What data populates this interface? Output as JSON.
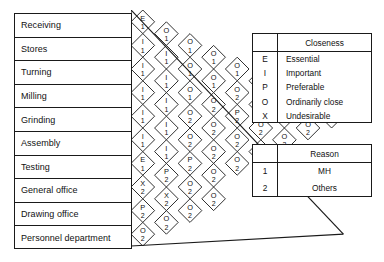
{
  "activities": [
    {
      "id": 1,
      "label": "Receiving"
    },
    {
      "id": 2,
      "label": "Stores"
    },
    {
      "id": 3,
      "label": "Turning"
    },
    {
      "id": 4,
      "label": "Milling"
    },
    {
      "id": 5,
      "label": "Grinding"
    },
    {
      "id": 6,
      "label": "Assembly"
    },
    {
      "id": 7,
      "label": "Testing"
    },
    {
      "id": 8,
      "label": "General office"
    },
    {
      "id": 9,
      "label": "Drawing office"
    },
    {
      "id": 10,
      "label": "Personnel department"
    }
  ],
  "relationship_matrix": {
    "description": "Activity relationship chart. Each diamond holds a closeness code (top) and a reason code (bottom).",
    "columns": [
      {
        "from": 1,
        "cells": [
          {
            "to": 2,
            "closeness": "E",
            "reason": "1"
          },
          {
            "to": 3,
            "closeness": "I",
            "reason": "1"
          },
          {
            "to": 4,
            "closeness": "I",
            "reason": "1"
          },
          {
            "to": 5,
            "closeness": "I",
            "reason": "1"
          },
          {
            "to": 6,
            "closeness": "I",
            "reason": "1"
          },
          {
            "to": 7,
            "closeness": "I",
            "reason": "1"
          },
          {
            "to": 8,
            "closeness": "E",
            "reason": "1"
          },
          {
            "to": 9,
            "closeness": "X",
            "reason": "2"
          },
          {
            "to": 10,
            "closeness": "P",
            "reason": "2"
          },
          {
            "to": 11,
            "closeness": "O",
            "reason": "2"
          }
        ]
      },
      {
        "from": 2,
        "cells": [
          {
            "to": 3,
            "closeness": "O",
            "reason": "1"
          },
          {
            "to": 4,
            "closeness": "I",
            "reason": "1"
          },
          {
            "to": 5,
            "closeness": "I",
            "reason": "1"
          },
          {
            "to": 6,
            "closeness": "I",
            "reason": "1"
          },
          {
            "to": 7,
            "closeness": "I",
            "reason": "1"
          },
          {
            "to": 8,
            "closeness": "I",
            "reason": "1"
          },
          {
            "to": 9,
            "closeness": "P",
            "reason": "2"
          },
          {
            "to": 10,
            "closeness": "X",
            "reason": "2"
          },
          {
            "to": 11,
            "closeness": "O",
            "reason": "2"
          }
        ]
      },
      {
        "from": 3,
        "cells": [
          {
            "to": 4,
            "closeness": "O",
            "reason": "1"
          },
          {
            "to": 5,
            "closeness": "O",
            "reason": "1"
          },
          {
            "to": 6,
            "closeness": "O",
            "reason": "1"
          },
          {
            "to": 7,
            "closeness": "O",
            "reason": "2"
          },
          {
            "to": 8,
            "closeness": "O",
            "reason": "2"
          },
          {
            "to": 9,
            "closeness": "P",
            "reason": "2"
          },
          {
            "to": 10,
            "closeness": "O",
            "reason": "2"
          },
          {
            "to": 11,
            "closeness": "O",
            "reason": "2"
          }
        ]
      },
      {
        "from": 4,
        "cells": [
          {
            "to": 5,
            "closeness": "O",
            "reason": "1"
          },
          {
            "to": 6,
            "closeness": "O",
            "reason": "1"
          },
          {
            "to": 7,
            "closeness": "O",
            "reason": "2"
          },
          {
            "to": 8,
            "closeness": "O",
            "reason": "2"
          },
          {
            "to": 9,
            "closeness": "O",
            "reason": "2"
          },
          {
            "to": 10,
            "closeness": "O",
            "reason": "2"
          },
          {
            "to": 11,
            "closeness": "O",
            "reason": "2"
          }
        ]
      },
      {
        "from": 5,
        "cells": [
          {
            "to": 6,
            "closeness": "O",
            "reason": "1"
          },
          {
            "to": 7,
            "closeness": "O",
            "reason": "2"
          },
          {
            "to": 8,
            "closeness": "P",
            "reason": "2"
          },
          {
            "to": 9,
            "closeness": "O",
            "reason": "2"
          },
          {
            "to": 10,
            "closeness": "O",
            "reason": "2"
          }
        ]
      },
      {
        "from": 6,
        "cells": [
          {
            "to": 7,
            "closeness": "O",
            "reason": "2"
          },
          {
            "to": 8,
            "closeness": "O",
            "reason": "2"
          },
          {
            "to": 9,
            "closeness": "O",
            "reason": "2"
          },
          {
            "to": 10,
            "closeness": "O",
            "reason": "2"
          }
        ]
      },
      {
        "from": 7,
        "cells": [
          {
            "to": 8,
            "closeness": "P",
            "reason": "2"
          },
          {
            "to": 9,
            "closeness": "O",
            "reason": "2"
          },
          {
            "to": 10,
            "closeness": "O",
            "reason": "2"
          }
        ]
      },
      {
        "from": 8,
        "cells": [
          {
            "to": 9,
            "closeness": "O",
            "reason": "2"
          },
          {
            "to": 10,
            "closeness": "O",
            "reason": "2"
          }
        ]
      },
      {
        "from": 9,
        "cells": [
          {
            "to": 10,
            "closeness": "O",
            "reason": "2"
          }
        ]
      }
    ]
  },
  "legend_closeness": {
    "header_key": "",
    "header_title": "Closeness",
    "rows": [
      {
        "key": "E",
        "value": "Essential"
      },
      {
        "key": "I",
        "value": "Important"
      },
      {
        "key": "P",
        "value": "Preferable"
      },
      {
        "key": "O",
        "value": "Ordinarily close"
      },
      {
        "key": "X",
        "value": "Undesirable"
      }
    ]
  },
  "legend_reason": {
    "header_key": "",
    "header_title": "Reason",
    "rows": [
      {
        "key": "1",
        "value": "MH"
      },
      {
        "key": "2",
        "value": "Others"
      }
    ]
  },
  "colors": {
    "line": "#1a1a1a",
    "text": "#111111",
    "background": "#ffffff"
  }
}
